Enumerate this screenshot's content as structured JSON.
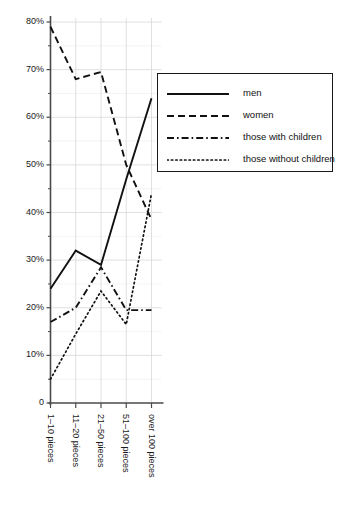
{
  "chart_data": {
    "type": "line",
    "title": "",
    "subtitle": "",
    "xlabel": "",
    "ylabel": "",
    "categories": [
      "1–10 pieces",
      "11–20 pieces",
      "21–50 pieces",
      "51–100 pieces",
      "over 100 pieces"
    ],
    "ylim": [
      0,
      80
    ],
    "ytick_labels": [
      "0",
      "10%",
      "20%",
      "30%",
      "40%",
      "50%",
      "60%",
      "70%",
      "80%"
    ],
    "ytick_values": [
      0,
      10,
      20,
      30,
      40,
      50,
      60,
      70,
      80
    ],
    "yminor_values": [
      5,
      15,
      25,
      35,
      45,
      55,
      65,
      75
    ],
    "grid": true,
    "legend_position": "upper right",
    "series": [
      {
        "name": "men",
        "style": "solid",
        "values": [
          24,
          32,
          29,
          47,
          64
        ]
      },
      {
        "name": "women",
        "style": "dashed",
        "values": [
          79,
          68,
          69.5,
          50,
          38.5
        ]
      },
      {
        "name": "those with children",
        "style": "dash-dot",
        "values": [
          17,
          20,
          28.5,
          19.5,
          19.5
        ]
      },
      {
        "name": "those without children",
        "style": "dotted",
        "values": [
          5,
          14.5,
          23.5,
          16.5,
          44
        ]
      }
    ]
  },
  "legend": {
    "items": [
      {
        "label": "men",
        "sample": "solid-line-sample"
      },
      {
        "label": "women",
        "sample": "dashed-line-sample"
      },
      {
        "label": "those with children",
        "sample": "dash-dot-line-sample"
      },
      {
        "label": "those without children",
        "sample": "dotted-line-sample"
      }
    ]
  },
  "axes": {
    "y_labels": [
      "80%",
      "70%",
      "60%",
      "50%",
      "40%",
      "30%",
      "20%",
      "10%",
      "0"
    ],
    "x_labels": [
      "1–10 pieces",
      "11–20 pieces",
      "21–50 pieces",
      "51–100 pieces",
      "over 100 pieces"
    ]
  },
  "colors": {
    "line": "#111111",
    "axis": "#4a4a4a",
    "grid": "#d8d8d8",
    "background": "#ffffff"
  }
}
